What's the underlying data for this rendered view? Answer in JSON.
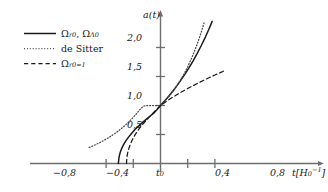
{
  "chart_data": {
    "type": "line",
    "title": "",
    "xlabel": "t[H_0^-1]",
    "ylabel": "a(t)",
    "xlim": [
      -1.05,
      1.05
    ],
    "ylim": [
      0.0,
      2.45
    ],
    "grid": false,
    "legend_position": "top-left",
    "x_ticks": [
      {
        "value": -0.8,
        "label": "−0,8"
      },
      {
        "value": -0.4,
        "label": "−0,4"
      },
      {
        "value": 0.0,
        "label": "t_0"
      },
      {
        "value": 0.4,
        "label": "0,4"
      },
      {
        "value": 0.8,
        "label": "0,8"
      }
    ],
    "y_ticks": [
      {
        "value": 0.5,
        "label": "0,5"
      },
      {
        "value": 1.0,
        "label": "1,0"
      },
      {
        "value": 1.5,
        "label": "1,5"
      },
      {
        "value": 2.0,
        "label": "2,0"
      }
    ],
    "series": [
      {
        "name": "Omega_r0, Omega_Lambda0",
        "style": "solid",
        "color": "#1a1a1a",
        "points": [
          [
            -0.62,
            0.0
          ],
          [
            -0.612,
            0.09
          ],
          [
            -0.604,
            0.14
          ],
          [
            -0.594,
            0.185
          ],
          [
            -0.58,
            0.232
          ],
          [
            -0.56,
            0.287
          ],
          [
            -0.535,
            0.342
          ],
          [
            -0.505,
            0.398
          ],
          [
            -0.47,
            0.455
          ],
          [
            -0.43,
            0.513
          ],
          [
            -0.385,
            0.572
          ],
          [
            -0.335,
            0.632
          ],
          [
            -0.28,
            0.692
          ],
          [
            -0.22,
            0.752
          ],
          [
            -0.16,
            0.81
          ],
          [
            -0.1,
            0.868
          ],
          [
            -0.05,
            0.933
          ],
          [
            0.0,
            1.0
          ],
          [
            0.06,
            1.078
          ],
          [
            0.12,
            1.16
          ],
          [
            0.18,
            1.247
          ],
          [
            0.24,
            1.339
          ],
          [
            0.3,
            1.437
          ],
          [
            0.36,
            1.541
          ],
          [
            0.42,
            1.652
          ],
          [
            0.48,
            1.771
          ],
          [
            0.54,
            1.898
          ],
          [
            0.6,
            2.034
          ],
          [
            0.66,
            2.18
          ],
          [
            0.71,
            2.31
          ],
          [
            0.76,
            2.45
          ]
        ]
      },
      {
        "name": "de Sitter",
        "style": "dotted",
        "color": "#4a4a4a",
        "points": [
          [
            -1.05,
            0.275
          ],
          [
            -1.0,
            0.3
          ],
          [
            -0.95,
            0.327
          ],
          [
            -0.9,
            0.356
          ],
          [
            -0.85,
            0.387
          ],
          [
            -0.8,
            0.42
          ],
          [
            -0.75,
            0.456
          ],
          [
            -0.7,
            0.494
          ],
          [
            -0.65,
            0.535
          ],
          [
            -0.6,
            0.58
          ],
          [
            -0.55,
            0.628
          ],
          [
            -0.5,
            0.68
          ],
          [
            -0.45,
            0.736
          ],
          [
            -0.4,
            0.797
          ],
          [
            -0.35,
            0.863
          ],
          [
            -0.3,
            0.934
          ],
          [
            -0.25,
            0.99
          ],
          [
            -0.2,
            1.0
          ],
          [
            -0.15,
            1.0
          ],
          [
            -0.1,
            1.0
          ],
          [
            -0.05,
            1.0
          ],
          [
            0.0,
            1.0
          ],
          [
            0.05,
            1.06
          ],
          [
            0.1,
            1.124
          ],
          [
            0.15,
            1.195
          ],
          [
            0.2,
            1.272
          ],
          [
            0.25,
            1.356
          ],
          [
            0.3,
            1.45
          ],
          [
            0.35,
            1.553
          ],
          [
            0.4,
            1.668
          ],
          [
            0.45,
            1.795
          ],
          [
            0.5,
            1.936
          ],
          [
            0.55,
            2.093
          ],
          [
            0.6,
            2.268
          ],
          [
            0.64,
            2.425
          ]
        ]
      },
      {
        "name": "Omega_r0=1",
        "style": "dashed",
        "color": "#1a1a1a",
        "points": [
          [
            -0.5,
            0.0
          ],
          [
            -0.494,
            0.11
          ],
          [
            -0.486,
            0.165
          ],
          [
            -0.476,
            0.215
          ],
          [
            -0.462,
            0.272
          ],
          [
            -0.444,
            0.33
          ],
          [
            -0.422,
            0.39
          ],
          [
            -0.396,
            0.45
          ],
          [
            -0.366,
            0.51
          ],
          [
            -0.332,
            0.57
          ],
          [
            -0.294,
            0.63
          ],
          [
            -0.252,
            0.69
          ],
          [
            -0.206,
            0.75
          ],
          [
            -0.156,
            0.812
          ],
          [
            -0.104,
            0.875
          ],
          [
            -0.052,
            0.938
          ],
          [
            0.0,
            1.0
          ],
          [
            0.08,
            1.066
          ],
          [
            0.16,
            1.128
          ],
          [
            0.24,
            1.186
          ],
          [
            0.32,
            1.241
          ],
          [
            0.4,
            1.293
          ],
          [
            0.48,
            1.343
          ],
          [
            0.56,
            1.391
          ],
          [
            0.64,
            1.437
          ],
          [
            0.72,
            1.482
          ],
          [
            0.8,
            1.525
          ],
          [
            0.88,
            1.567
          ],
          [
            0.95,
            1.603
          ]
        ]
      }
    ]
  },
  "legend": {
    "entries": [
      {
        "style": "solid",
        "label_main": "Ω",
        "label_sub1": "r0",
        "label_mid": ", ",
        "label_main2": "Ω",
        "label_sub2": "Λ0",
        "plain": "Ωr0, ΩΛ0"
      },
      {
        "style": "dotted",
        "plain": "de Sitter"
      },
      {
        "style": "dashed",
        "label_main": "Ω",
        "label_sub1": "r0=1",
        "plain": "Ωr0=1"
      }
    ]
  },
  "axes": {
    "y_axis_label": "a(t)",
    "x_axis_label_base": "t[H",
    "x_axis_label_sub": "0",
    "x_axis_label_sup": "−1",
    "x_axis_label_close": "]"
  },
  "colors": {
    "axis": "#6e6e6e",
    "curve_primary": "#1a1a1a",
    "curve_desitter": "#4a4a4a",
    "text": "#1a1a1a",
    "background": "#ffffff"
  }
}
